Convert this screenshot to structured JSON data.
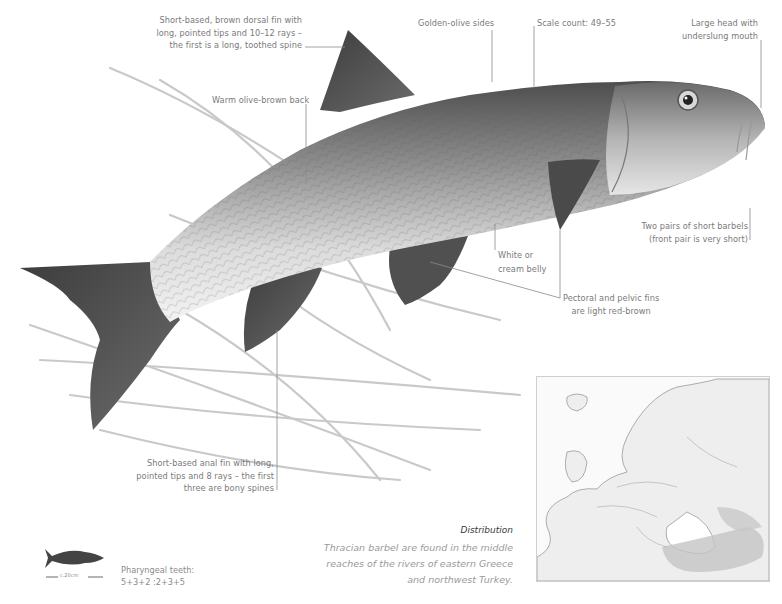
{
  "annotations": {
    "dorsal_fin": [
      "Short-based, brown dorsal fin with",
      "long, pointed tips and 10–12 rays –",
      "the first is a long, toothed spine"
    ],
    "sides": "Golden-olive sides",
    "scale_count": "Scale count: 49–55",
    "head": [
      "Large head with",
      "underslung mouth"
    ],
    "back": "Warm olive-brown back",
    "barbels": [
      "Two pairs of short barbels",
      "(front pair is very short)"
    ],
    "belly": [
      "White or",
      "cream belly"
    ],
    "pectoral_pelvic": [
      "Pectoral and pelvic fins",
      "are light red-brown"
    ],
    "anal_fin": [
      "Short-based anal fin with long,",
      "pointed tips and 8 rays – the first",
      "three are bony spines"
    ]
  },
  "distribution": {
    "title": "Distribution",
    "text": [
      "Thracian barbel are found in the middle",
      "reaches of the rivers of eastern Greece",
      "and northwest Turkey."
    ]
  },
  "size_guide": {
    "scale_label": "c.20cm",
    "icon": "fish-silhouette-icon"
  },
  "pharyngeal_teeth": {
    "label": "Pharyngeal teeth:",
    "formula": "5+3+2 :2+3+5"
  },
  "map": {
    "region": "Europe",
    "highlight": "Greece and northwest Turkey"
  },
  "colors": {
    "text": "#7a7a7a",
    "fin": "#4a4a4a",
    "body_light": "#e8e8e8",
    "range_shade": "#c4c4c4"
  }
}
